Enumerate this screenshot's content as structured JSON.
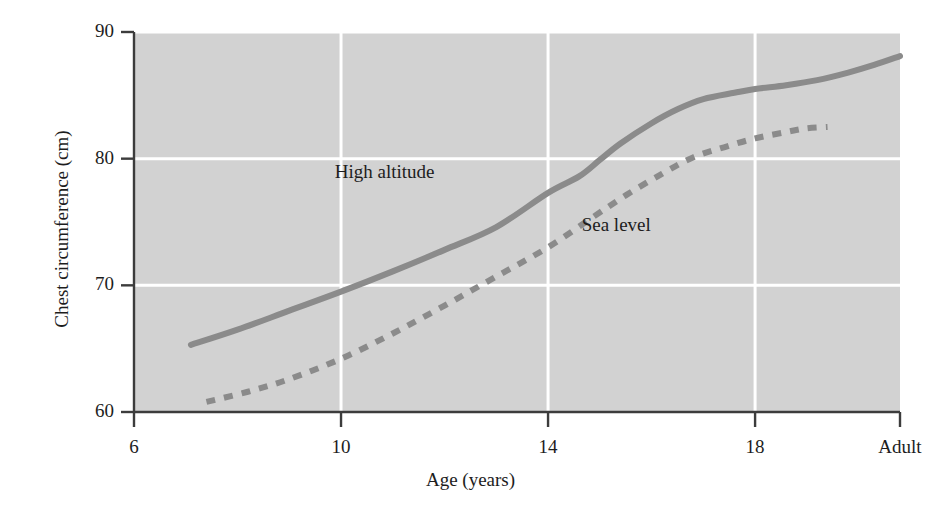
{
  "chart_data": {
    "type": "line",
    "title": "",
    "xlabel": "Age (years)",
    "ylabel": "Chest circumference (cm)",
    "xlim": [
      6,
      20.8
    ],
    "ylim": [
      60,
      90
    ],
    "xticks": [
      "6",
      "10",
      "14",
      "18",
      "Adult"
    ],
    "xtick_values": [
      6,
      10,
      14,
      18,
      20.8
    ],
    "yticks": [
      "60",
      "70",
      "80",
      "90"
    ],
    "ytick_values": [
      60,
      70,
      80,
      90
    ],
    "grid": "white gridlines on gray panel, at each tick",
    "legend_position": "inline annotations next to curves",
    "panel_color": "#d2d2d2",
    "line_color": "#8b8b8b",
    "axis_color": "#3c3c3c",
    "series": [
      {
        "name": "High altitude",
        "style": "solid",
        "label_x": 11.0,
        "label_y": 78.8,
        "x": [
          7.1,
          8.0,
          9.0,
          10.0,
          11.0,
          12.0,
          13.0,
          14.0,
          14.6,
          15.0,
          15.4,
          16.0,
          16.5,
          17.0,
          17.6,
          18.0,
          18.6,
          19.2,
          19.8,
          20.3,
          20.8
        ],
        "y": [
          65.3,
          66.5,
          68.0,
          69.5,
          71.1,
          72.8,
          74.6,
          77.3,
          78.6,
          79.9,
          81.2,
          82.8,
          83.9,
          84.7,
          85.2,
          85.5,
          85.8,
          86.2,
          86.8,
          87.4,
          88.1
        ]
      },
      {
        "name": "Sea level",
        "style": "dashed",
        "label_x": 15.5,
        "label_y": 74.6,
        "x": [
          7.4,
          8.2,
          9.0,
          10.0,
          11.0,
          12.0,
          13.0,
          14.0,
          14.8,
          15.5,
          16.2,
          16.8,
          17.4,
          18.0,
          18.6,
          19.0,
          19.4
        ],
        "y": [
          60.8,
          61.6,
          62.6,
          64.2,
          66.2,
          68.4,
          70.7,
          73.0,
          75.2,
          77.1,
          78.8,
          80.1,
          80.9,
          81.6,
          82.1,
          82.4,
          82.5
        ]
      }
    ]
  },
  "axes": {
    "y_title": "Chest circumference (cm)",
    "x_title": "Age (years)",
    "y_tick_labels": [
      "90",
      "80",
      "70",
      "60"
    ],
    "x_tick_labels": [
      "6",
      "10",
      "14",
      "18",
      "Adult"
    ]
  },
  "annotations": {
    "high_altitude": "High altitude",
    "sea_level": "Sea level"
  }
}
